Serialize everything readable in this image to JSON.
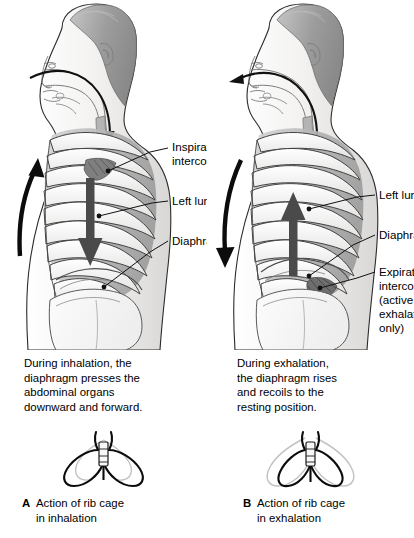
{
  "figure": {
    "background_color": "#ffffff",
    "ink_color": "#000000",
    "skin_shade": "#f0efee",
    "hair_shade": "#9a9a9a",
    "lung_shade": "#b9b9b9",
    "ghost_shade": "#c9c9c9"
  },
  "panels": [
    {
      "id": "A",
      "letter": "A",
      "labels": [
        {
          "name": "inspiratory-intercostals",
          "lines": [
            "Inspiratory",
            "intercostals"
          ]
        },
        {
          "name": "left-lung",
          "lines": [
            "Left lung"
          ]
        },
        {
          "name": "diaphragm",
          "lines": [
            "Diaphragm"
          ]
        }
      ],
      "caption": [
        "During inhalation, the",
        "diaphragm presses the",
        "abdominal organs",
        "downward and forward."
      ],
      "panel_label": [
        "Action of rib cage",
        "in inhalation"
      ],
      "airflow": "in",
      "rib_cage_arrow": "up",
      "diaphragm_arrow": "down"
    },
    {
      "id": "B",
      "letter": "B",
      "labels": [
        {
          "name": "left-lung",
          "lines": [
            "Left lung"
          ]
        },
        {
          "name": "diaphragm",
          "lines": [
            "Diaphragm"
          ]
        },
        {
          "name": "expiratory-intercostals",
          "lines": [
            "Expiratory",
            "intercostals",
            "(active",
            "exhalation",
            "only)"
          ]
        }
      ],
      "caption": [
        "During exhalation,",
        "the diaphragm rises",
        "and recoils to the",
        "resting position."
      ],
      "panel_label": [
        "Action of rib cage",
        "in exhalation"
      ],
      "airflow": "out",
      "rib_cage_arrow": "down",
      "diaphragm_arrow": "up"
    }
  ]
}
